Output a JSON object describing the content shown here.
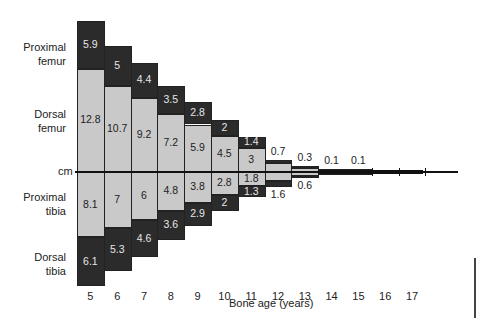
{
  "chart_data": {
    "type": "bar",
    "subtype": "diverging-stacked",
    "title": "",
    "xlabel": "Bone age (years)",
    "ylabel": "cm",
    "categories": [
      "5",
      "6",
      "7",
      "8",
      "9",
      "10",
      "11",
      "12",
      "13",
      "14",
      "15",
      "16",
      "17"
    ],
    "series": [
      {
        "name": "Proximal femur",
        "side": "above",
        "position": "outer",
        "shade": "dark",
        "values": [
          5.9,
          5,
          4.4,
          3.5,
          2.8,
          2,
          1.4,
          0.7,
          0.3,
          0.1,
          0.1,
          null,
          null
        ]
      },
      {
        "name": "Dorsal femur",
        "side": "above",
        "position": "inner",
        "shade": "light",
        "values": [
          12.8,
          10.7,
          9.2,
          7.2,
          5.9,
          4.5,
          3,
          null,
          null,
          null,
          null,
          null,
          null
        ]
      },
      {
        "name": "Proximal tibia",
        "side": "below",
        "position": "inner",
        "shade": "light",
        "values": [
          8.1,
          7,
          6,
          4.8,
          3.8,
          2.8,
          1.8,
          null,
          null,
          null,
          null,
          null,
          null
        ]
      },
      {
        "name": "Dorsal tibia",
        "side": "below",
        "position": "outer",
        "shade": "dark",
        "values": [
          6.1,
          5.3,
          4.6,
          3.6,
          2.9,
          2,
          1.3,
          1.6,
          0.6,
          null,
          null,
          null,
          null
        ]
      }
    ],
    "row_labels": {
      "proximal_femur": [
        "Proximal",
        "femur"
      ],
      "dorsal_femur": [
        "Dorsal",
        "femur"
      ],
      "cm": "cm",
      "proximal_tibia": [
        "Proximal",
        "tibia"
      ],
      "dorsal_tibia": [
        "Dorsal",
        "tibia"
      ]
    },
    "grid": false,
    "legend": "none (row labels on left)"
  },
  "labels": {
    "proximal_femur_1": "Proximal",
    "proximal_femur_2": "femur",
    "dorsal_femur_1": "Dorsal",
    "dorsal_femur_2": "femur",
    "cm": "cm",
    "proximal_tibia_1": "Proximal",
    "proximal_tibia_2": "tibia",
    "dorsal_tibia_1": "Dorsal",
    "dorsal_tibia_2": "tibia",
    "xlabel": "Bone age (years)"
  },
  "colors": {
    "dark": "#2b2b2b",
    "light": "#c9c9c9",
    "axis": "#111111"
  }
}
